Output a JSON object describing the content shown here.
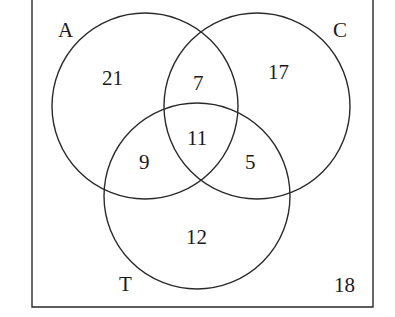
{
  "diagram": {
    "type": "venn-3",
    "sets": [
      {
        "name": "A",
        "label": "A"
      },
      {
        "name": "C",
        "label": "C"
      },
      {
        "name": "T",
        "label": "T"
      }
    ],
    "regions": {
      "A_only": "21",
      "C_only": "17",
      "T_only": "12",
      "A_and_C_only": "7",
      "A_and_T_only": "9",
      "C_and_T_only": "5",
      "A_and_C_and_T": "11",
      "outside": "18"
    },
    "colors": {
      "stroke": "#2a2a2a",
      "text": "#1a1a1a",
      "background": "#ffffff"
    }
  }
}
